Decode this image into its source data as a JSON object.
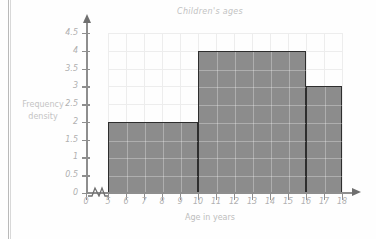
{
  "page": {
    "background_color": "#fefefe",
    "rule_color": "#b9b9b9"
  },
  "chart_data": {
    "type": "bar",
    "title": "Children's ages",
    "xlabel": "Age in years",
    "ylabel": "Frequency density",
    "grid": true,
    "legend": null,
    "xlim": [
      5,
      18
    ],
    "ylim": [
      0,
      4.5
    ],
    "x_axis_break": true,
    "x_tick_labels": [
      "0",
      "5",
      "6",
      "7",
      "8",
      "9",
      "10",
      "11",
      "12",
      "13",
      "14",
      "15",
      "16",
      "17",
      "18"
    ],
    "y_tick_labels": [
      "0",
      "0.5",
      "1",
      "1.5",
      "2",
      "2.5",
      "3",
      "3.5",
      "4",
      "4.5"
    ],
    "bars": [
      {
        "label": "5-10",
        "x_start": 5,
        "x_end": 10,
        "value": 2
      },
      {
        "label": "10-16",
        "x_start": 10,
        "x_end": 16,
        "value": 4
      },
      {
        "label": "16-18",
        "x_start": 16,
        "x_end": 18,
        "value": 3
      }
    ],
    "bar_fill_color": "#8c8c8c",
    "bar_edge_color": "#2e2e2e"
  }
}
